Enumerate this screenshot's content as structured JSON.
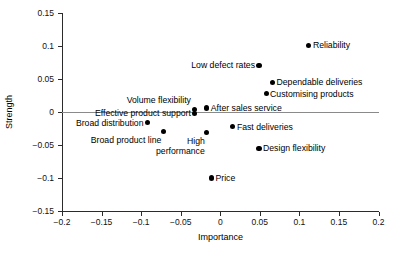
{
  "chart_data": {
    "type": "scatter",
    "title": "",
    "xlabel": "Importance",
    "ylabel": "Strength",
    "xlim": [
      -0.2,
      0.2
    ],
    "ylim": [
      -0.15,
      0.15
    ],
    "grid": false,
    "legend": "none",
    "xticks": [
      "-0.2",
      "-0.15",
      "-0.1",
      "-0.05",
      "0",
      "0.05",
      "0.1",
      "0.15",
      "0.2"
    ],
    "xtick_values": [
      -0.2,
      -0.15,
      -0.1,
      -0.05,
      0,
      0.05,
      0.1,
      0.15,
      0.2
    ],
    "yticks": [
      "0.15",
      "0.1",
      "0.05",
      "0",
      "-0.05",
      "-0.1",
      "-0.15"
    ],
    "ytick_values": [
      0.15,
      0.1,
      0.05,
      0,
      -0.05,
      -0.1,
      -0.15
    ],
    "reference_line_y": 0,
    "points": [
      {
        "label": "Reliability",
        "x": 0.112,
        "y": 0.101,
        "label_side": "right"
      },
      {
        "label": "Low defect rates",
        "x": 0.049,
        "y": 0.071,
        "label_side": "left"
      },
      {
        "label": "Dependable deliveries",
        "x": 0.066,
        "y": 0.045,
        "label_side": "right"
      },
      {
        "label": "Customising products",
        "x": 0.058,
        "y": 0.028,
        "label_side": "right"
      },
      {
        "label": "Volume flexibility",
        "x": -0.032,
        "y": 0.004,
        "label_side": "above"
      },
      {
        "label": "Effective product support",
        "x": -0.032,
        "y": -0.002,
        "label_side": "left"
      },
      {
        "label": "After sales service",
        "x": -0.017,
        "y": 0.006,
        "label_side": "right"
      },
      {
        "label": "Broad distribution",
        "x": -0.092,
        "y": -0.016,
        "label_side": "left"
      },
      {
        "label": "Broad product line",
        "x": -0.072,
        "y": -0.03,
        "label_side": "below-left"
      },
      {
        "label": "High\nperformance",
        "x": -0.017,
        "y": -0.031,
        "label_side": "below-left"
      },
      {
        "label": "Fast deliveries",
        "x": 0.016,
        "y": -0.022,
        "label_side": "right"
      },
      {
        "label": "Design flexibility",
        "x": 0.049,
        "y": -0.055,
        "label_side": "right"
      },
      {
        "label": "Price",
        "x": -0.011,
        "y": -0.1,
        "label_side": "right"
      }
    ]
  },
  "axis": {
    "x_title": "Importance",
    "y_title": "Strength"
  },
  "source_note": ""
}
